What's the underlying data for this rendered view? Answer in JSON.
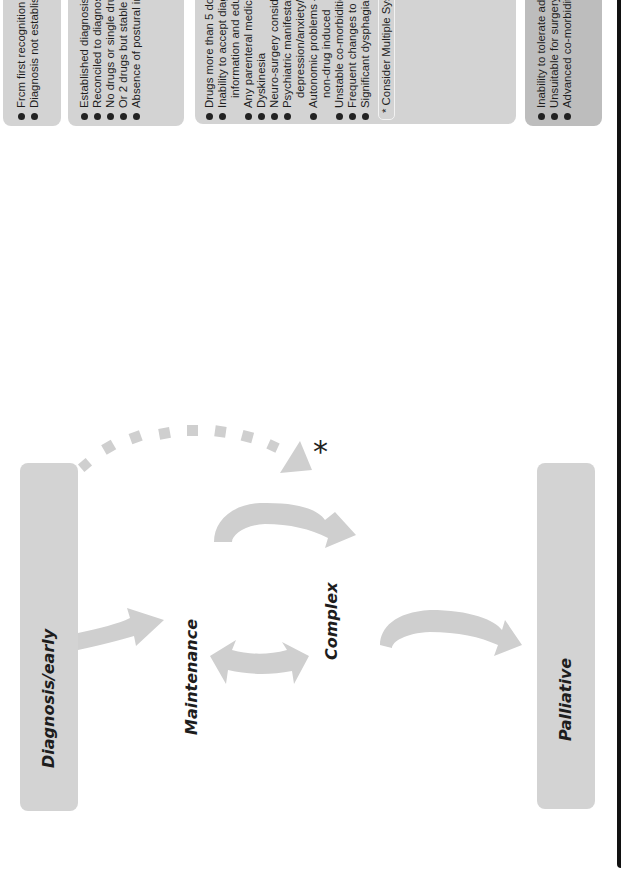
{
  "stages": {
    "diagnosis": "Diagnosis/early",
    "maintenance": "Maintenance",
    "complex": "Complex",
    "palliative": "Palliative"
  },
  "criteria": {
    "diagnosis": [
      "Frcm first recognition of symptoms/sign/problem",
      "Diagnosis not established cr accepted"
    ],
    "maintenance": [
      "Established diagnosis of PD",
      "Reconciled to diagnosis",
      "No drugs or single drug: 4 or less doses/day",
      "Or 2 drugs but stable medication for >3/12",
      "Absence of postural instability"
    ],
    "complex": [
      "Drugs more than 5 doses or more than 2 drugs",
      "Inability to accept diagnosis despite adequate",
      "information and education",
      "Any parenteral medications (apomorphine)",
      "Dyskinesia",
      "Neuro-surgery considered",
      "Psychiatric manifestations >mild symptoms of",
      "depression/anxiety/hallucinations/psychosis",
      "Autonomic problems – hypotension either drug- or",
      "non-drug induced",
      "Unstable co-morbidities",
      "Frequent changes to medication (<3/12)",
      "Significant dysphagia or aspiration"
    ],
    "complex_note": "* Consider Multiple System Atrophy from diagnosis",
    "palliative": [
      "Inability to tolerate adequate dopaminergic therapy",
      "Unsuitable for surgery",
      "Advanced co-morbidity (life threatening or disabling)"
    ]
  },
  "asterisk": "*",
  "colors": {
    "box_fill": "#d3d3d3",
    "box_fill_dark": "#bdbdbd",
    "arrow_fill": "#cfcfcf",
    "text": "#1d1d1d",
    "bar": "#111111"
  }
}
